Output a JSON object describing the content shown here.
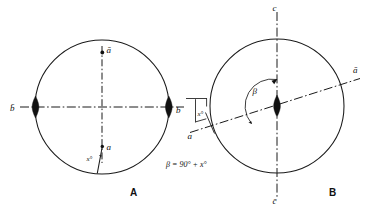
{
  "figure": {
    "background_color": "#ffffff",
    "stroke_color": "#1a1a1a",
    "width": 371,
    "height": 210
  },
  "panel_a": {
    "caption": "A",
    "circle": {
      "cx": 102,
      "cy": 107,
      "r": 67
    },
    "labels": {
      "b_bar_left": "b̄",
      "b_right": "b",
      "a_bar_top": "ā",
      "a_bottom": "a",
      "angle_x": "x°"
    },
    "horizontal_axis_name": "b-b-bar axis",
    "vertical_axis_name": "a-a-bar axis"
  },
  "panel_b": {
    "caption": "B",
    "circle": {
      "cx": 277,
      "cy": 106,
      "r": 67
    },
    "labels": {
      "c_top": "c",
      "c_bar_bottom": "c̄",
      "a_bar_upper_right": "ā",
      "a_lower_left": "a",
      "angle_beta": "β",
      "angle_x": "x°"
    },
    "inclined_axis_name": "a-a-bar inclined axis",
    "vertical_axis_name": "c-c-bar axis"
  },
  "formula": {
    "text": "β = 90° + x°"
  }
}
